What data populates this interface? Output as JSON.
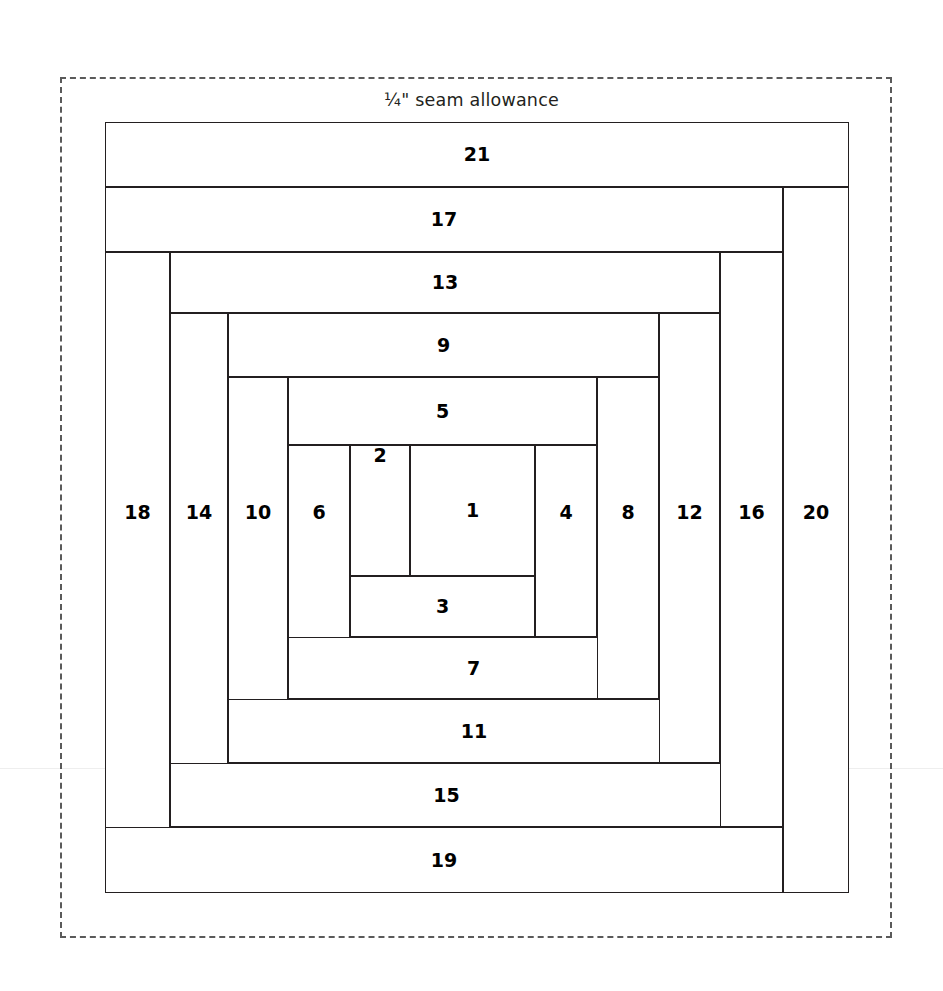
{
  "diagram": {
    "type": "log-cabin-quilt-block",
    "seam_allowance_label": "¼\" seam allowance",
    "colors": {
      "line": "#231f20",
      "dashed_guide": "#5a5a5a",
      "background": "#ffffff",
      "label_text": "#000000"
    },
    "canvas": {
      "width": 943,
      "height": 991
    },
    "seam_allowance_rect": {
      "x": 60,
      "y": 77,
      "width": 832,
      "height": 861
    },
    "block_rect": {
      "x": 105,
      "y": 122,
      "width": 744,
      "height": 771
    },
    "piece_count": 21,
    "pieces": [
      {
        "label": "1",
        "orientation": "center",
        "x": 305,
        "y": 323,
        "width": 125,
        "height": 131,
        "label_offset": 0
      },
      {
        "label": "2",
        "orientation": "vertical",
        "x": 245,
        "y": 323,
        "width": 60,
        "height": 131,
        "label_offset": 0
      },
      {
        "label": "3",
        "orientation": "horizontal",
        "x": 245,
        "y": 454,
        "width": 185,
        "height": 61,
        "label_offset": 0
      },
      {
        "label": "4",
        "orientation": "vertical",
        "x": 430,
        "y": 323,
        "width": 62,
        "height": 192,
        "label_offset": 66
      },
      {
        "label": "5",
        "orientation": "horizontal",
        "x": 183,
        "y": 255,
        "width": 309,
        "height": 68,
        "label_offset": 0
      },
      {
        "label": "6",
        "orientation": "vertical",
        "x": 183,
        "y": 323,
        "width": 62,
        "height": 254,
        "label_offset": 66
      },
      {
        "label": "7",
        "orientation": "horizontal",
        "x": 183,
        "y": 515,
        "width": 371,
        "height": 62,
        "label_offset": 0
      },
      {
        "label": "8",
        "orientation": "vertical",
        "x": 492,
        "y": 255,
        "width": 62,
        "height": 322,
        "label_offset": 66
      },
      {
        "label": "9",
        "orientation": "horizontal",
        "x": 123,
        "y": 191,
        "width": 431,
        "height": 64,
        "label_offset": 0
      },
      {
        "label": "10",
        "orientation": "vertical",
        "x": 123,
        "y": 255,
        "width": 60,
        "height": 386,
        "label_offset": 66
      },
      {
        "label": "11",
        "orientation": "horizontal",
        "x": 123,
        "y": 577,
        "width": 492,
        "height": 64,
        "label_offset": 0
      },
      {
        "label": "12",
        "orientation": "vertical",
        "x": 554,
        "y": 191,
        "width": 61,
        "height": 450,
        "label_offset": 66
      },
      {
        "label": "13",
        "orientation": "horizontal",
        "x": 65,
        "y": 130,
        "width": 550,
        "height": 61,
        "label_offset": 0
      },
      {
        "label": "14",
        "orientation": "vertical",
        "x": 65,
        "y": 191,
        "width": 58,
        "height": 514,
        "label_offset": 66
      },
      {
        "label": "15",
        "orientation": "horizontal",
        "x": 65,
        "y": 641,
        "width": 553,
        "height": 64,
        "label_offset": 0
      },
      {
        "label": "16",
        "orientation": "vertical",
        "x": 615,
        "y": 130,
        "width": 63,
        "height": 575,
        "label_offset": 66
      },
      {
        "label": "17",
        "orientation": "horizontal",
        "x": 0,
        "y": 65,
        "width": 678,
        "height": 65,
        "label_offset": 0
      },
      {
        "label": "18",
        "orientation": "vertical",
        "x": 0,
        "y": 130,
        "width": 65,
        "height": 641,
        "label_offset": 66
      },
      {
        "label": "19",
        "orientation": "horizontal",
        "x": 0,
        "y": 705,
        "width": 678,
        "height": 66,
        "label_offset": 0
      },
      {
        "label": "20",
        "orientation": "vertical",
        "x": 678,
        "y": 65,
        "width": 66,
        "height": 706,
        "label_offset": 66
      },
      {
        "label": "21",
        "orientation": "horizontal",
        "x": 0,
        "y": 0,
        "width": 744,
        "height": 65,
        "label_offset": 0
      }
    ]
  }
}
